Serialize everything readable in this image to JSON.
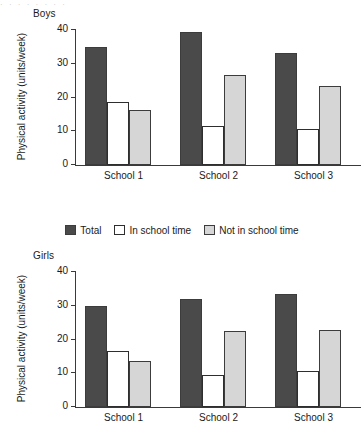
{
  "top_strip_text": "· ·   ·     ·  ·        ·        ·   ·",
  "legend": {
    "items": [
      {
        "label": "Total",
        "color": "#4a4a4a",
        "icon": "filled-square-dark"
      },
      {
        "label": "In school time",
        "color": "#ffffff",
        "icon": "outlined-square-white"
      },
      {
        "label": "Not in school time",
        "color": "#d6d6d6",
        "icon": "filled-square-light"
      }
    ]
  },
  "chart_data": [
    {
      "type": "bar",
      "title": "Boys",
      "xlabel": "",
      "ylabel": "Physical activity (units/week)",
      "categories": [
        "School 1",
        "School 2",
        "School 3"
      ],
      "series": [
        {
          "name": "Total",
          "color": "#4a4a4a",
          "values": [
            35.0,
            39.3,
            33.2
          ]
        },
        {
          "name": "In school time",
          "color": "#ffffff",
          "values": [
            18.7,
            11.5,
            10.7
          ]
        },
        {
          "name": "Not in school time",
          "color": "#d6d6d6",
          "values": [
            16.3,
            26.8,
            23.3
          ]
        }
      ],
      "ylim": [
        0,
        40
      ],
      "yticks": [
        0,
        10,
        20,
        30,
        40
      ],
      "grid": false,
      "legend_position": "below-plot-shared"
    },
    {
      "type": "bar",
      "title": "Girls",
      "xlabel": "",
      "ylabel": "Physical activity (units/week)",
      "categories": [
        "School 1",
        "School 2",
        "School 3"
      ],
      "series": [
        {
          "name": "Total",
          "color": "#4a4a4a",
          "values": [
            30.0,
            32.0,
            33.6
          ]
        },
        {
          "name": "In school time",
          "color": "#ffffff",
          "values": [
            16.5,
            9.6,
            10.8
          ]
        },
        {
          "name": "Not in school time",
          "color": "#d6d6d6",
          "values": [
            13.5,
            22.6,
            22.7
          ]
        }
      ],
      "ylim": [
        0,
        40
      ],
      "yticks": [
        0,
        10,
        20,
        30,
        40
      ],
      "grid": false,
      "legend_position": "above-plot-shared"
    }
  ]
}
